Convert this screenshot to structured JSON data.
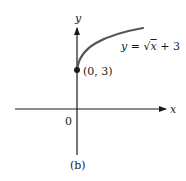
{
  "figure": {
    "panel_label": "(b)",
    "axes": {
      "x_label": "x",
      "y_label": "y",
      "origin_label": "0"
    },
    "curve": {
      "equation_prefix": "y = ",
      "equation_radicand": "x",
      "equation_suffix": " + 3",
      "equation_text": "y = √x + 3"
    },
    "point": {
      "label": "(0, 3)",
      "x": 0,
      "y": 3
    },
    "colors": {
      "axis": "#1a1a1a",
      "curve": "#555555",
      "point": "#1a1a1a"
    }
  }
}
